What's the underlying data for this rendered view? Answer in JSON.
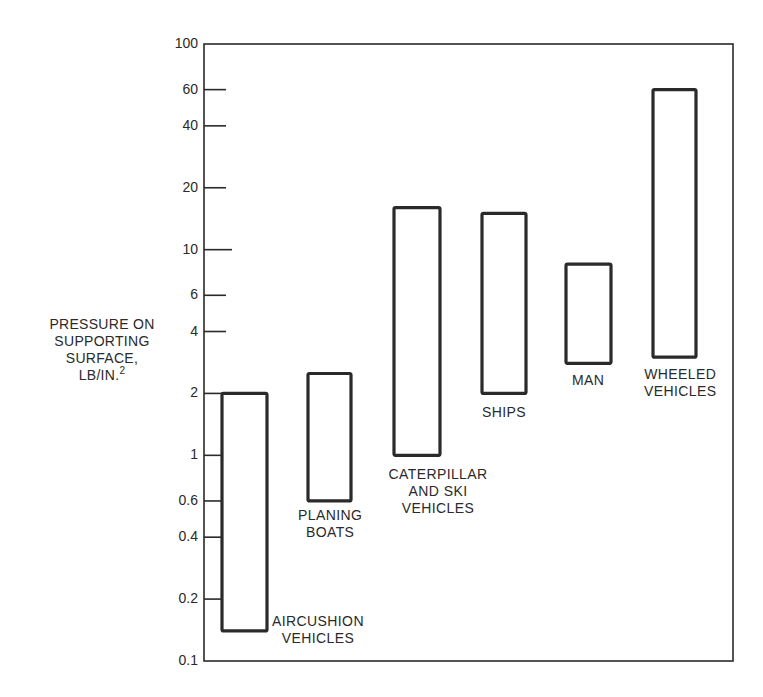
{
  "chart_data": {
    "type": "bar",
    "subtype": "floating-range-bar",
    "title": "",
    "xlabel": "",
    "ylabel": "PRESSURE ON SUPPORTING SURFACE, LB/IN.2",
    "ylabel_lines": [
      "PRESSURE ON",
      "SUPPORTING",
      "SURFACE,",
      "LB/IN."
    ],
    "ylabel_superscript": "2",
    "yscale": "log",
    "ylim": [
      0.1,
      100
    ],
    "grid": false,
    "legend": null,
    "yticks": [
      {
        "value": 100,
        "label": "100"
      },
      {
        "value": 60,
        "label": "60"
      },
      {
        "value": 40,
        "label": "40"
      },
      {
        "value": 20,
        "label": "20"
      },
      {
        "value": 10,
        "label": "10"
      },
      {
        "value": 6,
        "label": "6"
      },
      {
        "value": 4,
        "label": "4"
      },
      {
        "value": 2,
        "label": "2"
      },
      {
        "value": 1,
        "label": "1"
      },
      {
        "value": 0.6,
        "label": "0.6"
      },
      {
        "value": 0.4,
        "label": "0.4"
      },
      {
        "value": 0.2,
        "label": "0.2"
      },
      {
        "value": 0.1,
        "label": "0.1"
      }
    ],
    "categories": [
      "AIRCUSHION VEHICLES",
      "PLANING BOATS",
      "CATERPILLAR AND SKI VEHICLES",
      "SHIPS",
      "MAN",
      "WHEELED VEHICLES"
    ],
    "series": [
      {
        "name": "min",
        "values": [
          0.14,
          0.6,
          1.0,
          2.0,
          2.8,
          3.0
        ]
      },
      {
        "name": "max",
        "values": [
          2.0,
          2.5,
          16,
          15,
          8.5,
          60
        ]
      }
    ],
    "bars": [
      {
        "label_lines": [
          "AIRCUSHION",
          "VEHICLES"
        ],
        "min": 0.14,
        "max": 2.0,
        "x": 222,
        "w": 45,
        "label_pos": "right-bottom",
        "lx": 272,
        "ly": 613
      },
      {
        "label_lines": [
          "PLANING",
          "BOATS"
        ],
        "min": 0.6,
        "max": 2.5,
        "x": 308,
        "w": 43,
        "label_pos": "below",
        "lx": 330,
        "ly": 507
      },
      {
        "label_lines": [
          "CATERPILLAR",
          "AND SKI",
          "VEHICLES"
        ],
        "min": 1.0,
        "max": 16,
        "x": 394,
        "w": 46,
        "label_pos": "below",
        "lx": 438,
        "ly": 466
      },
      {
        "label_lines": [
          "SHIPS"
        ],
        "min": 2.0,
        "max": 15,
        "x": 482,
        "w": 44,
        "label_pos": "below",
        "lx": 504,
        "ly": 404
      },
      {
        "label_lines": [
          "MAN"
        ],
        "min": 2.8,
        "max": 8.5,
        "x": 566,
        "w": 45,
        "label_pos": "below",
        "lx": 588,
        "ly": 372
      },
      {
        "label_lines": [
          "WHEELED",
          "VEHICLES"
        ],
        "min": 3.0,
        "max": 60,
        "x": 653,
        "w": 43,
        "label_pos": "below",
        "lx": 680,
        "ly": 366
      }
    ],
    "colors": {
      "ink": "#2a2a2a",
      "background": "#ffffff"
    }
  }
}
